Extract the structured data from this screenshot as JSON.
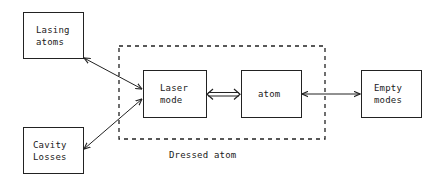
{
  "diagram": {
    "nodes": {
      "lasing_atoms": {
        "lines": [
          "Lasing",
          "atoms"
        ]
      },
      "cavity_losses": {
        "lines": [
          "Cavity",
          "Losses"
        ]
      },
      "laser_mode": {
        "lines": [
          "Laser",
          "mode"
        ]
      },
      "atom": {
        "lines": [
          "atom"
        ]
      },
      "empty_modes": {
        "lines": [
          "Empty",
          "modes"
        ]
      }
    },
    "group": {
      "label": "Dressed atom",
      "members": [
        "laser_mode",
        "atom"
      ],
      "style": "dashed"
    },
    "edges": [
      {
        "from": "lasing_atoms",
        "to": "laser_mode",
        "type": "bidirectional"
      },
      {
        "from": "cavity_losses",
        "to": "laser_mode",
        "type": "bidirectional"
      },
      {
        "from": "laser_mode",
        "to": "atom",
        "type": "double-line bidirectional"
      },
      {
        "from": "atom",
        "to": "empty_modes",
        "type": "bidirectional"
      }
    ]
  }
}
